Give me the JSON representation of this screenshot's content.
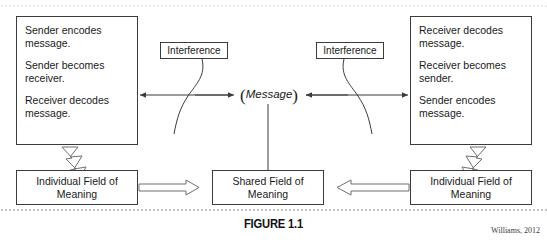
{
  "figure": {
    "caption": "FIGURE 1.1",
    "attribution": "Williams, 2012",
    "center_label": "Message",
    "paren_open": "(",
    "paren_close": ")"
  },
  "boxes": {
    "left_top": {
      "lines": [
        "Sender encodes message.",
        "Sender becomes receiver.",
        "Receiver decodes message."
      ]
    },
    "right_top": {
      "lines": [
        "Receiver decodes message.",
        "Receiver becomes sender.",
        "Sender encodes message."
      ]
    },
    "interference_left": {
      "label": "Interference"
    },
    "interference_right": {
      "label": "Interference"
    },
    "field_left": {
      "label": "Individual Field of Meaning"
    },
    "field_shared": {
      "label": "Shared Field of Meaning"
    },
    "field_right": {
      "label": "Individual Field of Meaning"
    }
  },
  "colors": {
    "stroke": "#3b3b3b",
    "text": "#1a1a1a",
    "shadow": "#d2d2d2",
    "dotted_rule": "#b9b9b9"
  }
}
